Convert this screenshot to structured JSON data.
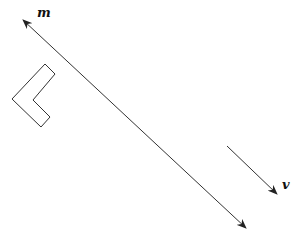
{
  "diagram": {
    "background": "#ffffff",
    "stroke_color": "#333333",
    "line_m": {
      "label": "m",
      "start": [
        23,
        20
      ],
      "end": [
        246,
        228
      ],
      "arrows": "both",
      "label_pos": [
        37,
        17
      ]
    },
    "vector_v": {
      "label": "v",
      "start": [
        227,
        146
      ],
      "end": [
        277,
        194
      ],
      "arrows": "end",
      "label_pos": [
        282,
        189
      ]
    },
    "l_shape": {
      "points": [
        [
          45,
          64
        ],
        [
          55,
          74
        ],
        [
          33,
          100
        ],
        [
          50,
          117
        ],
        [
          41,
          127
        ],
        [
          12,
          99
        ]
      ]
    }
  }
}
